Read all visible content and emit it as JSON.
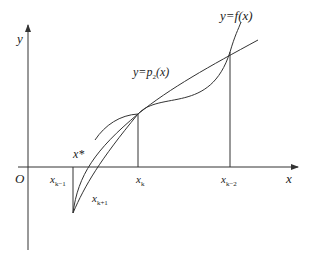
{
  "axes": {
    "x_label": "x",
    "y_label": "y",
    "origin_label": "O"
  },
  "curves": {
    "f_label": "y=f(x)",
    "p_label_prefix": "y=p",
    "p_label_sub": "2",
    "p_label_suffix": "(x)"
  },
  "points": {
    "root_label": "x*",
    "xk_minus1": {
      "base": "x",
      "sub": "k−1"
    },
    "xk": {
      "base": "x",
      "sub": "k"
    },
    "xk_minus2": {
      "base": "x",
      "sub": "k−2"
    },
    "xk_plus1": {
      "base": "x",
      "sub": "k+1"
    }
  },
  "colors": {
    "line": "#333333"
  }
}
